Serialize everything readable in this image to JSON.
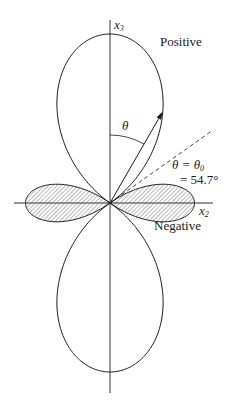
{
  "figure": {
    "type": "polar-lobe-diagram",
    "function": "P2(cos θ) = (3cos²θ − 1)/2",
    "origin": [
      110,
      203
    ],
    "scale_px": 169,
    "axes": {
      "x2": {
        "label": "x",
        "sub": "2",
        "from": 14,
        "to": 213
      },
      "x3": {
        "label": "x",
        "sub": "3",
        "from": 20,
        "to": 393
      }
    },
    "lobes": {
      "positive": {
        "label": "Positive",
        "shaded": false
      },
      "negative": {
        "label": "Negative",
        "shaded": true
      }
    },
    "angle": {
      "symbol": "θ",
      "arrow_angle_deg": 30,
      "magic_angle_deg": 54.7,
      "annotation_line1": "θ = θ",
      "annotation_line1_sub": "0",
      "annotation_line2": "= 54.7°"
    },
    "colors": {
      "line": "#1a1a1a",
      "hatch": "#555555",
      "background": "#ffffff"
    }
  }
}
